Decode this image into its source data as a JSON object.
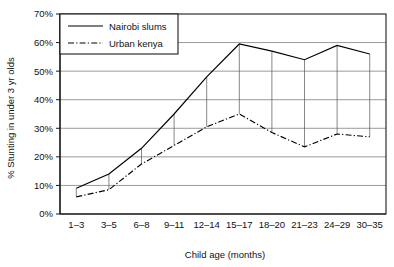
{
  "chart_data": {
    "type": "line",
    "title": "",
    "subtitle": "",
    "xlabel": "Child age (months)",
    "ylabel": "% Stunting in under 3 yr olds",
    "categories": [
      "1–3",
      "3–5",
      "6–8",
      "9–11",
      "12–14",
      "15–17",
      "18–20",
      "21–23",
      "24–29",
      "30–35"
    ],
    "series": [
      {
        "name": "Nairobi slums",
        "style": "solid",
        "values": [
          9,
          14,
          23,
          35,
          48,
          59.5,
          57,
          54,
          59,
          56
        ]
      },
      {
        "name": "Urban kenya",
        "style": "dash-dot",
        "values": [
          6,
          8.5,
          17.5,
          24,
          30.5,
          35,
          28.5,
          23.5,
          28,
          27
        ]
      }
    ],
    "ylim": [
      0,
      70
    ],
    "ytick_step": 10,
    "ytick_labels": [
      "0%",
      "10%",
      "20%",
      "30%",
      "40%",
      "50%",
      "60%",
      "70%"
    ],
    "grid": "horizontal",
    "legend_position": "top-left-inside",
    "connectors": true,
    "line_color": "#000000",
    "grid_color": "#6e6e6e",
    "frame_color": "#1a1a1a",
    "background": "#ffffff"
  },
  "axes": {
    "y_title": "% Stunting in under 3 yr olds",
    "x_title": "Child age (months)"
  },
  "legend": {
    "entries": [
      {
        "label": "Nairobi slums",
        "style": "solid"
      },
      {
        "label": "Urban kenya",
        "style": "dash-dot"
      }
    ]
  }
}
